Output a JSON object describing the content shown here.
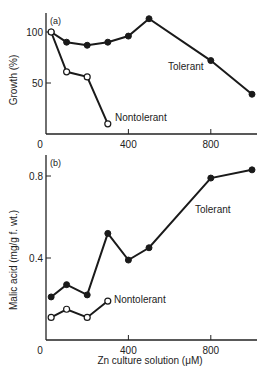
{
  "chart_data": [
    {
      "type": "line",
      "panel_label": "(a)",
      "title": "",
      "xlabel": "",
      "ylabel": "Growth (%)",
      "xlim": [
        0,
        1000
      ],
      "ylim": [
        0,
        120
      ],
      "x_ticks": [
        0,
        400,
        800
      ],
      "x_tick_labels": [
        "0",
        "400",
        "800"
      ],
      "y_ticks": [
        50,
        100
      ],
      "y_tick_labels": [
        "50",
        "100"
      ],
      "grid": false,
      "series": [
        {
          "name": "Tolerant",
          "marker": "filled-circle",
          "x": [
            25,
            100,
            200,
            300,
            400,
            500,
            800,
            1000
          ],
          "values": [
            100,
            90,
            87,
            90,
            96,
            113,
            72,
            39
          ]
        },
        {
          "name": "Nontolerant",
          "marker": "open-circle",
          "x": [
            25,
            100,
            200,
            300
          ],
          "values": [
            100,
            61,
            56,
            10
          ]
        }
      ]
    },
    {
      "type": "line",
      "panel_label": "(b)",
      "title": "",
      "xlabel": "Zn culture solution (μM)",
      "ylabel": "Malic acid (mg/g f. wt.)",
      "xlim": [
        0,
        1000
      ],
      "ylim": [
        0,
        0.9
      ],
      "x_ticks": [
        0,
        400,
        800
      ],
      "x_tick_labels": [
        "0",
        "400",
        "800"
      ],
      "y_ticks": [
        0.4,
        0.8
      ],
      "y_tick_labels": [
        "0.4",
        "0.8"
      ],
      "grid": false,
      "series": [
        {
          "name": "Tolerant",
          "marker": "filled-circle",
          "x": [
            25,
            100,
            200,
            300,
            400,
            500,
            800,
            1000
          ],
          "values": [
            0.21,
            0.27,
            0.22,
            0.52,
            0.39,
            0.45,
            0.79,
            0.83
          ]
        },
        {
          "name": "Nontolerant",
          "marker": "open-circle",
          "x": [
            25,
            100,
            200,
            300
          ],
          "values": [
            0.11,
            0.15,
            0.11,
            0.19
          ]
        }
      ]
    }
  ]
}
